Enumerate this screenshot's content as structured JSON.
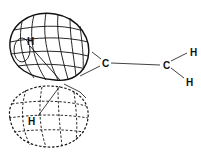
{
  "diagram": {
    "type": "molecular-orbital",
    "atoms": {
      "carbon_1": "C",
      "carbon_2": "C",
      "h_upper_lobe": "H",
      "h_lower_lobe": "H",
      "h_right_top": "H",
      "h_right_bottom": "H"
    },
    "lobes": [
      {
        "name": "upper-lobe",
        "style": "solid"
      },
      {
        "name": "lower-lobe",
        "style": "dashed"
      }
    ],
    "colors": {
      "ink": "#111111",
      "background": "#ffffff"
    }
  }
}
